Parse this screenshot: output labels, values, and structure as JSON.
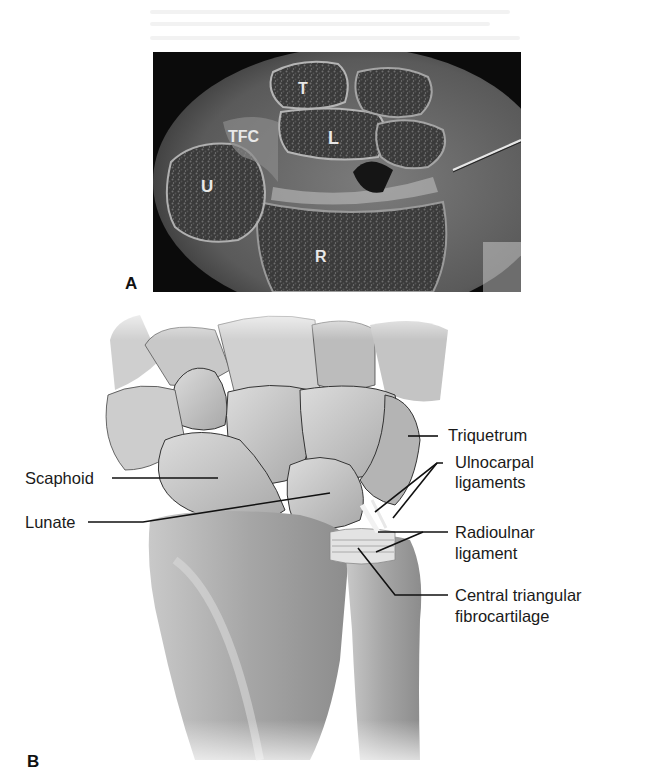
{
  "figure": {
    "panels": [
      {
        "letter": "A",
        "kind": "photograph",
        "description": "Coronal section of wrist (cadaver)",
        "labels": {
          "trapezoid_or_triquetrum": "T",
          "tfc": "TFC",
          "lunate": "L",
          "ulna": "U",
          "radius": "R"
        }
      },
      {
        "letter": "B",
        "kind": "illustration",
        "description": "Dorsal view of wrist bones and TFCC",
        "callouts": {
          "triquetrum": "Triquetrum",
          "ulnocarpal_1": "Ulnocarpal",
          "ulnocarpal_2": "ligaments",
          "scaphoid": "Scaphoid",
          "lunate": "Lunate",
          "radioulnar_1": "Radioulnar",
          "radioulnar_2": "ligament",
          "central_1": "Central triangular",
          "central_2": "fibrocartilage"
        }
      }
    ]
  },
  "colors": {
    "photo_bg": "#0b0b0b",
    "bone_fill": "#d6d6d6",
    "bone_outline": "#2a2a2a",
    "leader_line": "#111111",
    "text": "#1a1a1a"
  }
}
